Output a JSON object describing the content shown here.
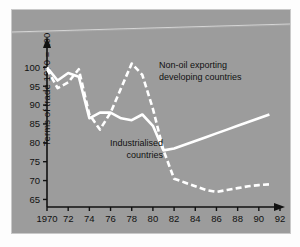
{
  "figure": {
    "background_color": "#9c9c9c",
    "line_color": "#ffffff",
    "axis_color": "#111111",
    "page_color": "#fdfdfd"
  },
  "chart_data": {
    "type": "line",
    "title": "",
    "subtitle": "",
    "xlabel": "",
    "ylabel": "Terms of trade 1970 = 100",
    "xlim": [
      1970,
      92
    ],
    "ylim": [
      63,
      103
    ],
    "grid": false,
    "legend_position": "inline-annotations",
    "x_tick_labels": [
      "1970",
      "72",
      "74",
      "76",
      "78",
      "80",
      "82",
      "84",
      "86",
      "88",
      "90",
      "92"
    ],
    "x_tick_values": [
      1970,
      1972,
      1974,
      1976,
      1978,
      1980,
      1982,
      1984,
      1986,
      1988,
      1990,
      1992
    ],
    "y_tick_labels": [
      "65",
      "70",
      "75",
      "80",
      "85",
      "90",
      "95",
      "100"
    ],
    "y_tick_values": [
      65,
      70,
      75,
      80,
      85,
      90,
      95,
      100
    ],
    "series": [
      {
        "name": "Industrialised countries",
        "style": "solid",
        "color": "#ffffff",
        "x": [
          1970,
          1971,
          1972,
          1973,
          1974,
          1975,
          1976,
          1977,
          1978,
          1979,
          1980,
          1981,
          1982,
          1983,
          1984,
          1985,
          1986,
          1987,
          1988,
          1989,
          1990,
          1991
        ],
        "values": [
          100,
          96.5,
          98.5,
          97.5,
          86.5,
          88,
          88,
          86.5,
          86,
          87.5,
          84.5,
          78,
          78.5,
          79.5,
          80.5,
          81.5,
          82.5,
          83.5,
          84.5,
          85.5,
          86.5,
          87.5
        ]
      },
      {
        "name": "Non-oil exporting developing countries",
        "style": "dashed",
        "color": "#ffffff",
        "x": [
          1970,
          1971,
          1972,
          1973,
          1974,
          1975,
          1976,
          1977,
          1978,
          1979,
          1980,
          1981,
          1982,
          1983,
          1984,
          1985,
          1986,
          1987,
          1988,
          1989,
          1990,
          1991
        ],
        "values": [
          99.5,
          94.5,
          96,
          99.5,
          87.5,
          83.5,
          88,
          94.5,
          101,
          98,
          89,
          78,
          70.5,
          69.5,
          68.5,
          67.5,
          67,
          67.5,
          68,
          68.5,
          68.8,
          69
        ]
      }
    ],
    "annotations": [
      {
        "name": "non-oil-exporting-label",
        "lines": [
          "Non-oil exporting",
          "developing countries"
        ],
        "align": "left",
        "x": 147,
        "y": 58
      },
      {
        "name": "industrialised-label",
        "lines": [
          "Industrialised",
          "countries"
        ],
        "align": "right",
        "x": 151,
        "y": 136
      }
    ]
  }
}
